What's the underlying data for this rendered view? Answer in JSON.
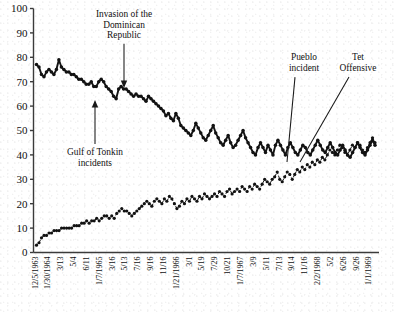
{
  "chart_data": {
    "type": "line",
    "title": "",
    "subtitle": "",
    "xlabel": "",
    "ylabel": "",
    "ylim": [
      0,
      100
    ],
    "ytick_step": 10,
    "grid": false,
    "legend_position": "none",
    "yticks": [
      "0",
      "10",
      "20",
      "30",
      "40",
      "50",
      "60",
      "70",
      "80",
      "90",
      "100"
    ],
    "x_tick_labels": [
      "12/5/1963",
      "1/30/1964",
      "3/13",
      "5/4",
      "6/11",
      "1/7/1965",
      "3/16",
      "5/13",
      "7/16",
      "9/16",
      "11/16",
      "1/21/1966",
      "3/1",
      "5/19",
      "7/29",
      "10/21",
      "1/7/1967",
      "3/9",
      "5/11",
      "7/13",
      "9/14",
      "11/16",
      "2/2/1968",
      "5/2",
      "6/26",
      "9/26",
      "1/1/1969"
    ],
    "series": [
      {
        "name": "approve",
        "marker": "solid-dot",
        "line": "solid-heavy",
        "values": [
          77,
          76,
          73,
          72,
          74,
          75,
          74,
          73,
          75,
          79,
          76,
          75,
          74,
          74,
          73,
          73,
          72,
          71,
          71,
          70,
          69,
          69,
          70,
          68,
          68,
          70,
          71,
          70,
          68,
          67,
          66,
          64,
          63,
          67,
          68,
          67,
          67,
          66,
          65,
          64,
          65,
          64,
          64,
          63,
          62,
          64,
          63,
          62,
          61,
          60,
          59,
          58,
          56,
          57,
          55,
          54,
          57,
          55,
          52,
          51,
          50,
          49,
          48,
          50,
          53,
          51,
          49,
          47,
          46,
          48,
          50,
          52,
          49,
          47,
          45,
          44,
          46,
          48,
          45,
          43,
          44,
          46,
          48,
          50,
          47,
          45,
          43,
          41,
          40,
          43,
          45,
          43,
          41,
          44,
          42,
          40,
          44,
          46,
          44,
          42,
          40,
          43,
          45,
          43,
          41,
          40,
          42,
          44,
          43,
          41,
          40,
          42,
          44,
          46,
          44,
          42,
          41,
          43,
          45,
          43,
          41,
          40,
          42,
          44,
          42,
          40,
          39,
          41,
          43,
          45,
          43,
          41,
          40,
          42,
          44,
          46,
          44
        ]
      },
      {
        "name": "disapprove",
        "marker": "solid-dot",
        "line": "dashed-light",
        "values": [
          3,
          4,
          6,
          7,
          7,
          8,
          8,
          9,
          9,
          9,
          10,
          10,
          10,
          10,
          10,
          11,
          11,
          11,
          12,
          12,
          13,
          12,
          13,
          13,
          14,
          13,
          14,
          15,
          15,
          14,
          15,
          14,
          16,
          17,
          18,
          17,
          17,
          16,
          15,
          16,
          17,
          18,
          19,
          20,
          21,
          20,
          19,
          21,
          22,
          21,
          20,
          22,
          21,
          23,
          22,
          20,
          18,
          19,
          21,
          20,
          22,
          21,
          23,
          22,
          21,
          23,
          22,
          24,
          23,
          22,
          23,
          24,
          23,
          25,
          24,
          23,
          25,
          26,
          24,
          25,
          26,
          25,
          27,
          26,
          25,
          27,
          26,
          28,
          27,
          26,
          28,
          30,
          29,
          28,
          30,
          31,
          33,
          30,
          29,
          31,
          33,
          32,
          30,
          32,
          34,
          33,
          35,
          34,
          36,
          35,
          37,
          36,
          38,
          37,
          39,
          38,
          40,
          42,
          41,
          40,
          42,
          44,
          43,
          41,
          40,
          42,
          44,
          43,
          45,
          44,
          42,
          41,
          43,
          45,
          47,
          45
        ]
      }
    ],
    "annotations": [
      {
        "id": "gulf-of-tonkin",
        "lines": [
          "Gulf of Tonkin",
          "incidents"
        ],
        "text": "Gulf of Tonkin incidents"
      },
      {
        "id": "invasion-dominican-republic",
        "lines": [
          "Invasion of the",
          "Dominican",
          "Republic"
        ],
        "text": "Invasion of the Dominican Republic"
      },
      {
        "id": "pueblo-incident",
        "lines": [
          "Pueblo",
          "incident"
        ],
        "text": "Pueblo incident"
      },
      {
        "id": "tet-offensive",
        "lines": [
          "Tet",
          "Offensive"
        ],
        "text": "Tet Offensive"
      }
    ]
  },
  "colors": {
    "ink": "#141414",
    "axis": "#3b3b3b",
    "paper": "#ffffff"
  }
}
